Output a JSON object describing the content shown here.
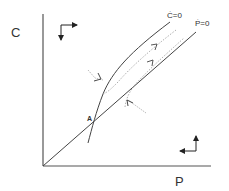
{
  "diagram": {
    "type": "phase-diagram",
    "axes": {
      "x_label": "P",
      "y_label": "C"
    },
    "curves": [
      {
        "id": "c-dot-nullcline",
        "label": "Ċ=0"
      },
      {
        "id": "p-dot-nullcline",
        "label": "Ṗ=0"
      }
    ],
    "points": [
      {
        "id": "equilibrium",
        "label": "A"
      }
    ],
    "direction_indicators": [
      {
        "region": "upper-left",
        "directions": [
          "right",
          "down"
        ]
      },
      {
        "region": "lower-right",
        "directions": [
          "up",
          "left"
        ]
      }
    ],
    "colors": {
      "line": "#444444",
      "dotted": "#999999",
      "text": "#333333"
    }
  }
}
